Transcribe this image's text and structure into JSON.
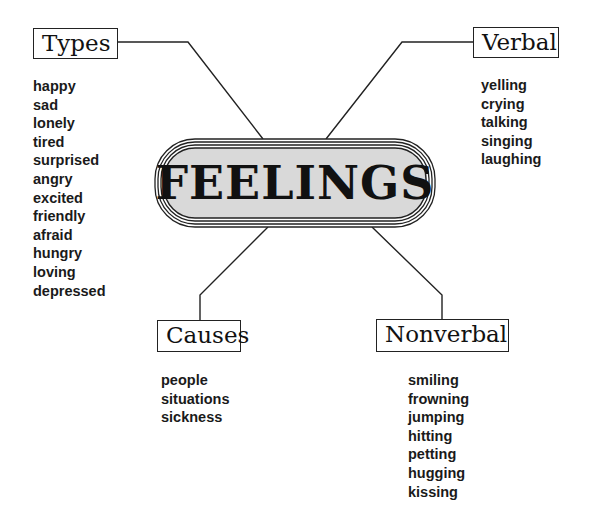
{
  "center": {
    "title": "FEELINGS",
    "fill": "#d9d9d9"
  },
  "branches": {
    "types": {
      "label": "Types",
      "items": [
        "happy",
        "sad",
        "lonely",
        "tired",
        "surprised",
        "angry",
        "excited",
        "friendly",
        "afraid",
        "hungry",
        "loving",
        "depressed"
      ]
    },
    "verbal": {
      "label": "Verbal",
      "items": [
        "yelling",
        "crying",
        "talking",
        "singing",
        "laughing"
      ]
    },
    "causes": {
      "label": "Causes",
      "items": [
        "people",
        "situations",
        "sickness"
      ]
    },
    "nonverbal": {
      "label": "Nonverbal",
      "items": [
        "smiling",
        "frowning",
        "jumping",
        "hitting",
        "petting",
        "hugging",
        "kissing"
      ]
    }
  }
}
